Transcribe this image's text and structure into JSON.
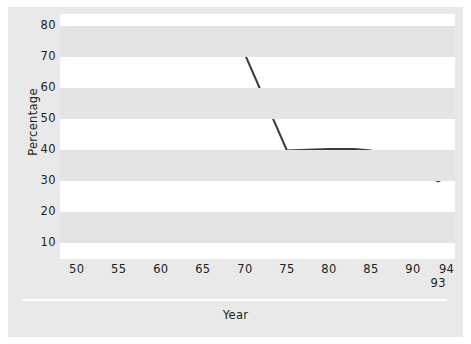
{
  "chart_data": {
    "type": "line",
    "title": "",
    "xlabel": "Year",
    "ylabel": "Percentage",
    "xlim": [
      48,
      95
    ],
    "ylim": [
      5,
      84
    ],
    "grid": "horizontal-alternating-bands",
    "legend": "none",
    "x_ticks": [
      "50",
      "55",
      "60",
      "65",
      "70",
      "75",
      "80",
      "85",
      "90",
      "94"
    ],
    "x_tick_values": [
      50,
      55,
      60,
      65,
      70,
      75,
      80,
      85,
      90,
      94
    ],
    "x_extra_ticks": [
      {
        "label": "93",
        "value": 93,
        "row": 2
      }
    ],
    "y_ticks": [
      "10",
      "20",
      "30",
      "40",
      "50",
      "60",
      "70",
      "80"
    ],
    "y_tick_values": [
      10,
      20,
      30,
      40,
      50,
      60,
      70,
      80
    ],
    "series": [
      {
        "name": "Percentage",
        "color": "#3a3a3a",
        "x": [
          55,
          70,
          75,
          80,
          83,
          85,
          90,
          93,
          94
        ],
        "values": [
          71,
          71,
          40,
          40.5,
          40.5,
          40,
          34,
          30,
          31.5
        ]
      }
    ]
  },
  "axes": {
    "y_title": "Percentage",
    "x_title": "Year"
  },
  "colors": {
    "background": "#e9e9e9",
    "plot_background": "#ffffff",
    "band": "#e4e4e4",
    "line": "#3a3a3a",
    "text": "#231f20",
    "separator": "#ffffff"
  }
}
